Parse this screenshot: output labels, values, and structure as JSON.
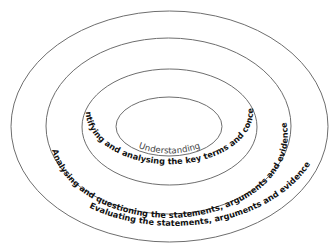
{
  "diagram": {
    "type": "concentric-ellipses",
    "center": [
      169.5,
      126.5
    ],
    "rings": [
      {
        "id": "understanding",
        "label": "Understanding",
        "rx": 53,
        "ry": 29.5
      },
      {
        "id": "identifying",
        "label": "Identifying and analysing the key terms and concepts",
        "rx": 87.5,
        "ry": 58
      },
      {
        "id": "analysing",
        "label": "Analysing and questioning the statements, arguments and evidence",
        "rx": 122.5,
        "ry": 88
      },
      {
        "id": "evaluating",
        "label": "Evaluating the statements, arguments and evidence",
        "rx": 158.5,
        "ry": 115.5
      }
    ],
    "stroke_color": "#6e6e6e",
    "text_color": "#111111"
  }
}
